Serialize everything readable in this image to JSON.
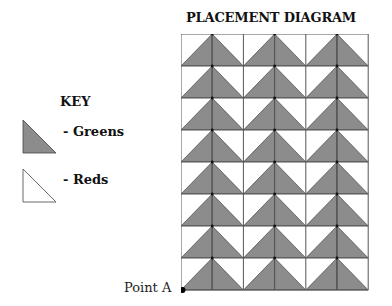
{
  "diagram": {
    "title": "PLACEMENT DIAGRAM",
    "rows": 8,
    "columns": 6,
    "cell_size_px": 31,
    "unit": "flying-geese",
    "units_per_row": 3
  },
  "key": {
    "title": "KEY",
    "items": [
      {
        "swatch": "gray-triangle",
        "label": "- Greens",
        "color": "#8c8c8c"
      },
      {
        "swatch": "white-triangle",
        "label": "- Reds",
        "color": "#ffffff"
      }
    ]
  },
  "point": {
    "label": "Point A"
  },
  "colors": {
    "fill_dark": "#8c8c8c",
    "fill_light": "#ffffff",
    "line": "#333333"
  }
}
